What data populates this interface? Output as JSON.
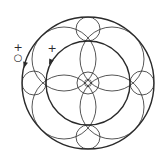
{
  "diagram": {
    "title": "",
    "stroke_color": "#2a2a2a",
    "background": "#ffffff",
    "center": [
      88,
      83
    ],
    "outer_circle": {
      "r": 66,
      "stroke_width": 1.4
    },
    "inner_circle": {
      "r": 42,
      "stroke_width": 1.4
    },
    "center_circle": {
      "r": 11,
      "stroke_width": 0.8
    },
    "center_marker": {
      "r": 3.5
    },
    "cardinal_circles": [
      {
        "pos": "top",
        "cx": 88,
        "cy": 29,
        "r": 12
      },
      {
        "pos": "bottom",
        "cx": 88,
        "cy": 137,
        "r": 12
      },
      {
        "pos": "left",
        "cx": 34,
        "cy": 83,
        "r": 12
      },
      {
        "pos": "right",
        "cx": 142,
        "cy": 83,
        "r": 12
      }
    ],
    "diagonal_circles": [
      {
        "pos": "top-left",
        "cx": 64,
        "cy": 59,
        "r": 32
      },
      {
        "pos": "top-right",
        "cx": 112,
        "cy": 59,
        "r": 32
      },
      {
        "pos": "bottom-left",
        "cx": 64,
        "cy": 107,
        "r": 32
      },
      {
        "pos": "bottom-right",
        "cx": 112,
        "cy": 107,
        "r": 32
      }
    ],
    "labels": [
      {
        "id": "outer-plus",
        "text": "+",
        "x": 18,
        "y": 51
      },
      {
        "id": "outer-charge",
        "text": "○",
        "x": 18,
        "y": 61
      },
      {
        "id": "inner-plus",
        "text": "+",
        "x": 52,
        "y": 52
      }
    ],
    "arrows": [
      {
        "id": "outer-arrow",
        "x": 24,
        "y": 68,
        "angle": 105
      },
      {
        "id": "inner-arrow",
        "x": 49,
        "y": 65,
        "angle": 115
      }
    ]
  }
}
